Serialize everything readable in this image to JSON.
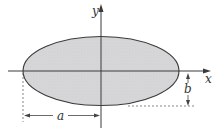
{
  "diagram": {
    "type": "ellipse-with-axes",
    "labels": {
      "x_axis": "x",
      "y_axis": "y",
      "semi_major": "a",
      "semi_minor": "b"
    },
    "colors": {
      "fill": "#d4d4d6",
      "stroke": "#3a3a3a",
      "background": "#ffffff"
    }
  }
}
